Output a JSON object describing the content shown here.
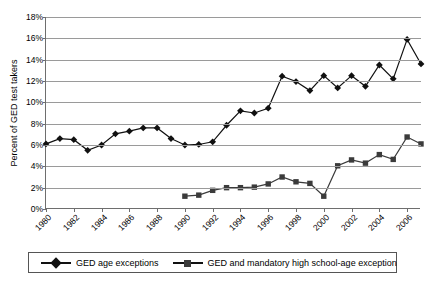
{
  "chart_data": {
    "type": "line",
    "title": "",
    "xlabel": "",
    "ylabel": "Percent of GED test takers",
    "ylim": [
      0,
      18
    ],
    "ytick_labels": [
      "18%",
      "16%",
      "14%",
      "12%",
      "10%",
      "8%",
      "6%",
      "4%",
      "2%",
      "0%"
    ],
    "ytick_values": [
      18,
      16,
      14,
      12,
      10,
      8,
      6,
      4,
      2,
      0
    ],
    "xtick_labels": [
      "1980",
      "1982",
      "1984",
      "1986",
      "1988",
      "1990",
      "1992",
      "1994",
      "1996",
      "1998",
      "2000",
      "2002",
      "2004",
      "2006"
    ],
    "xtick_values": [
      1980,
      1982,
      1984,
      1986,
      1988,
      1990,
      1992,
      1994,
      1996,
      1998,
      2000,
      2002,
      2004,
      2006
    ],
    "xlim": [
      1980,
      2007
    ],
    "grid": "horizontal",
    "legend_position": "bottom",
    "x": [
      1980,
      1981,
      1982,
      1983,
      1984,
      1985,
      1986,
      1987,
      1988,
      1989,
      1990,
      1991,
      1992,
      1993,
      1994,
      1995,
      1996,
      1997,
      1998,
      1999,
      2000,
      2001,
      2002,
      2003,
      2004,
      2005,
      2006,
      2007
    ],
    "series": [
      {
        "name": "GED age exceptions",
        "marker": "diamond",
        "color": "#111111",
        "x": [
          1980,
          1981,
          1982,
          1983,
          1984,
          1985,
          1986,
          1987,
          1988,
          1989,
          1990,
          1991,
          1992,
          1993,
          1994,
          1995,
          1996,
          1997,
          1998,
          1999,
          2000,
          2001,
          2002,
          2003,
          2004,
          2005,
          2006,
          2007
        ],
        "values": [
          6.1,
          6.6,
          6.5,
          5.5,
          6.0,
          7.05,
          7.3,
          7.6,
          7.6,
          6.6,
          6.0,
          6.05,
          6.3,
          7.85,
          9.2,
          9.0,
          9.45,
          12.45,
          11.95,
          11.1,
          12.5,
          11.35,
          12.5,
          11.5,
          13.5,
          12.2,
          15.9,
          13.6
        ]
      },
      {
        "name": "GED and mandatory high school-age exception",
        "marker": "square",
        "color": "#3b3b3b",
        "x": [
          1990,
          1991,
          1992,
          1993,
          1994,
          1995,
          1996,
          1997,
          1998,
          1999,
          2000,
          2001,
          2002,
          2003,
          2004,
          2005,
          2006,
          2007
        ],
        "values": [
          1.2,
          1.3,
          1.75,
          2.0,
          2.0,
          2.05,
          2.35,
          3.0,
          2.55,
          2.4,
          1.2,
          4.05,
          4.6,
          4.3,
          5.1,
          4.65,
          6.75,
          6.1
        ]
      }
    ]
  },
  "legend": {
    "items": [
      {
        "label": "GED age exceptions",
        "marker": "diamond-marker-icon"
      },
      {
        "label": "GED and mandatory high school-age exception",
        "marker": "square-marker-icon"
      }
    ]
  }
}
